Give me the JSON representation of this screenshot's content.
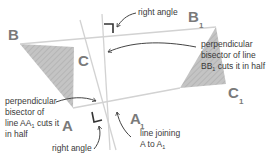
{
  "diagram": {
    "vertices": {
      "B": "B",
      "C": "C",
      "A": "A",
      "B1_main": "B",
      "B1_sub": "1",
      "C1_main": "C",
      "C1_sub": "1",
      "A1_main": "A",
      "A1_sub": "1"
    },
    "annotations": {
      "right_angle_top": "right angle",
      "bisector_bb1": {
        "line1": "perpendicular",
        "line2": "bisector of line",
        "line3_main": "BB",
        "line3_sub": "1",
        "line3_rest": " cuts it in half"
      },
      "bisector_aa1": {
        "line1": "perpendicular",
        "line2": "bisector of",
        "line3_main": "line AA",
        "line3_sub": "1",
        "line3_rest": " cuts it",
        "line4": "in half"
      },
      "right_angle_bottom": "right angle",
      "line_joining": {
        "line1": "line joining",
        "line2_main": "A to A",
        "line2_sub": "1"
      }
    },
    "colors": {
      "shape_fill": "#b9b9b9",
      "construction_line": "#d2d2d2",
      "arrow": "#444444",
      "vertex_label": "#7a7a7a"
    }
  }
}
